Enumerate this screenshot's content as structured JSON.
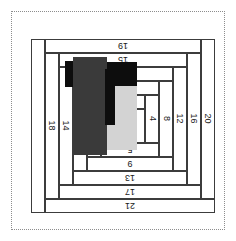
{
  "figure": {
    "orientation": "rotated-180",
    "background": "#ffffff",
    "frame_color": "#8d8d8d",
    "line_color": "#3c3c3c",
    "text_color": "#1a1a1a"
  },
  "strips": [
    {
      "id": "s1",
      "label": "1",
      "side": "center",
      "x": 70,
      "y": 78,
      "w": 30,
      "h": 34
    },
    {
      "id": "s2",
      "label": "2",
      "side": "right",
      "x": 100,
      "y": 78,
      "w": 14,
      "h": 34
    },
    {
      "id": "s3",
      "label": "3",
      "side": "bottom",
      "x": 70,
      "y": 112,
      "w": 44,
      "h": 14
    },
    {
      "id": "s4",
      "label": "4",
      "side": "left",
      "x": 56,
      "y": 78,
      "w": 14,
      "h": 48
    },
    {
      "id": "s5",
      "label": "5",
      "side": "top",
      "x": 56,
      "y": 64,
      "w": 58,
      "h": 14
    },
    {
      "id": "s6",
      "label": "6",
      "side": "right",
      "x": 114,
      "y": 64,
      "w": 14,
      "h": 62
    },
    {
      "id": "s7",
      "label": "7",
      "side": "bottom",
      "x": 56,
      "y": 126,
      "w": 72,
      "h": 14
    },
    {
      "id": "s8",
      "label": "8",
      "side": "left",
      "x": 42,
      "y": 64,
      "w": 14,
      "h": 76
    },
    {
      "id": "s9",
      "label": "9",
      "side": "top",
      "x": 42,
      "y": 50,
      "w": 86,
      "h": 14
    },
    {
      "id": "s10",
      "label": "10",
      "side": "right",
      "x": 128,
      "y": 50,
      "w": 14,
      "h": 90
    },
    {
      "id": "s11",
      "label": "11",
      "side": "bottom",
      "x": 42,
      "y": 140,
      "w": 100,
      "h": 14
    },
    {
      "id": "s12",
      "label": "12",
      "side": "left",
      "x": 28,
      "y": 50,
      "w": 14,
      "h": 104
    },
    {
      "id": "s13",
      "label": "13",
      "side": "top",
      "x": 28,
      "y": 36,
      "w": 114,
      "h": 14
    },
    {
      "id": "s14",
      "label": "14",
      "side": "right",
      "x": 142,
      "y": 36,
      "w": 14,
      "h": 118
    },
    {
      "id": "s15",
      "label": "15",
      "side": "bottom",
      "x": 28,
      "y": 154,
      "w": 128,
      "h": 14
    },
    {
      "id": "s16",
      "label": "16",
      "side": "left",
      "x": 14,
      "y": 36,
      "w": 14,
      "h": 132
    },
    {
      "id": "s17",
      "label": "17",
      "side": "top",
      "x": 14,
      "y": 22,
      "w": 142,
      "h": 14
    },
    {
      "id": "s18",
      "label": "18",
      "side": "right",
      "x": 156,
      "y": 22,
      "w": 14,
      "h": 146
    },
    {
      "id": "s19",
      "label": "19",
      "side": "bottom",
      "x": 14,
      "y": 168,
      "w": 156,
      "h": 14
    },
    {
      "id": "s20",
      "label": "20",
      "side": "left",
      "x": 0,
      "y": 22,
      "w": 14,
      "h": 160
    },
    {
      "id": "s21",
      "label": "21",
      "side": "top",
      "x": 0,
      "y": 8,
      "w": 170,
      "h": 14
    },
    {
      "id": "s22",
      "label": "",
      "side": "right",
      "x": 170,
      "y": 8,
      "w": 14,
      "h": 174
    }
  ],
  "blocks": [
    {
      "id": "b-light",
      "name": "light-gray-block",
      "color": "#d3d3d3",
      "x": 78,
      "y": 71,
      "w": 30,
      "h": 64
    },
    {
      "id": "b-black",
      "name": "black-block",
      "color": "#0d0d0d",
      "x": 78,
      "y": 135,
      "w": 30,
      "h": 24
    },
    {
      "id": "b-dark",
      "name": "dark-gray-block",
      "color": "#3a3a3a",
      "x": 108,
      "y": 66,
      "w": 34,
      "h": 98
    },
    {
      "id": "b-notch",
      "name": "black-notch",
      "color": "#0d0d0d",
      "x": 100,
      "y": 96,
      "w": 10,
      "h": 56
    },
    {
      "id": "b-edge",
      "name": "black-edge",
      "color": "#0d0d0d",
      "x": 142,
      "y": 134,
      "w": 8,
      "h": 26
    }
  ]
}
